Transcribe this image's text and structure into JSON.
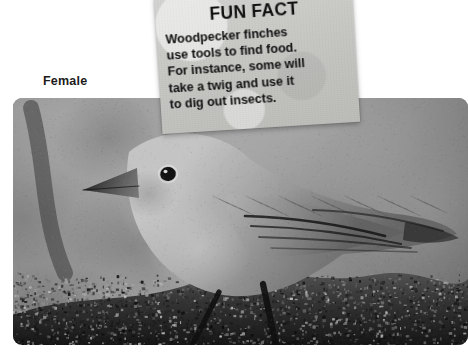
{
  "background_color": "#ffffff",
  "caption": {
    "label": "Female"
  },
  "note_card": {
    "title": "FUN FACT",
    "paper_color": "#c9c9c6",
    "text_color": "#101010",
    "lines": [
      "Woodpecker finches",
      "use tools to find food.",
      "For instance, some will",
      "take a twig and use it",
      "to dig out insects."
    ],
    "full_text": "Woodpecker finches use tools to find food. For instance, some will take a twig and use it to dig out insects."
  },
  "photo": {
    "subject": "woodpecker-finch-female",
    "description": "Black and white photograph of a female woodpecker finch perched on a mossy branch",
    "is_grayscale": true
  }
}
